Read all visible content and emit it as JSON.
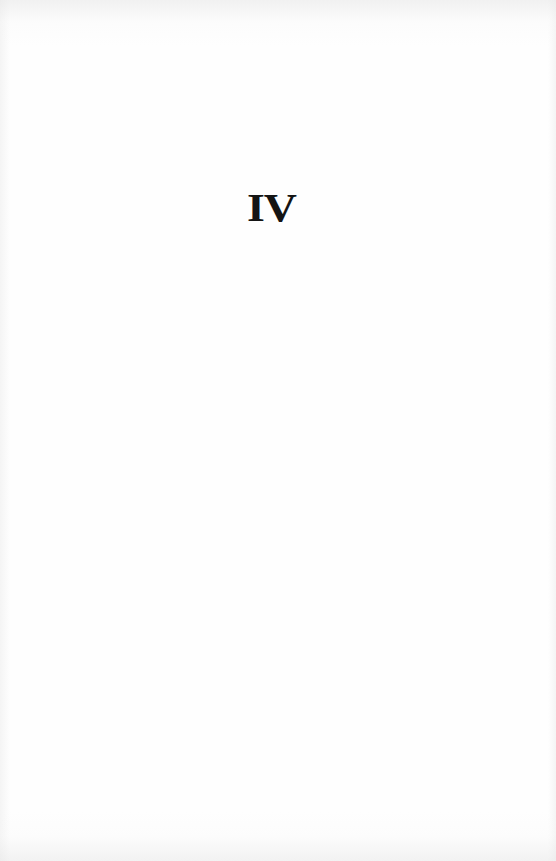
{
  "page": {
    "part_number": "IV"
  },
  "colors": {
    "paper": "#fefefe",
    "ink": "#141414"
  }
}
